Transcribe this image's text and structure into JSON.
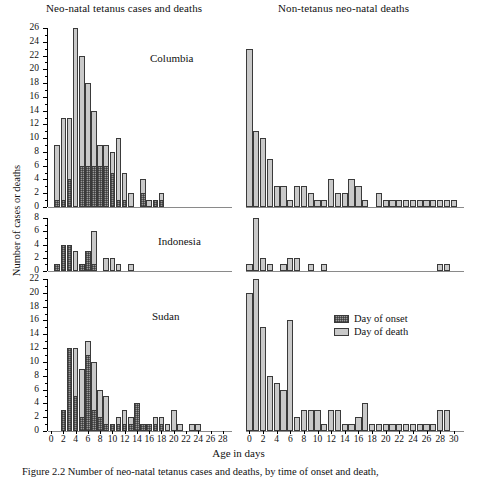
{
  "figure": {
    "column_titles": {
      "left": "Neo-natal tetanus cases and deaths",
      "right": "Non-tetanus neo-natal deaths"
    },
    "ylabel": "Number of cases or deaths",
    "xlabel": "Age in days",
    "caption": "Figure 2.2    Number of neo-natal tetanus cases and deaths, by time of onset and death,",
    "legend": {
      "position": "inside-right-middle",
      "items": [
        {
          "key": "onset",
          "label": "Day of onset"
        },
        {
          "key": "death",
          "label": "Day of death"
        }
      ]
    },
    "panel_labels": [
      "Columbia",
      "Indonesia",
      "Sudan"
    ]
  },
  "chart_data": [
    {
      "type": "bar",
      "title": "Columbia",
      "column": "Neo-natal tetanus cases and deaths",
      "xlabel": "Age in days",
      "ylabel": "Number of cases or deaths",
      "xlim": [
        0,
        29
      ],
      "ylim": [
        0,
        26
      ],
      "yticks": [
        0,
        2,
        4,
        6,
        8,
        10,
        12,
        14,
        16,
        18,
        20,
        22,
        24,
        26
      ],
      "xticks": [
        0,
        2,
        4,
        6,
        8,
        10,
        12,
        14,
        16,
        18,
        20,
        22,
        24,
        26,
        28
      ],
      "grid": false,
      "x": [
        0,
        1,
        2,
        3,
        4,
        5,
        6,
        7,
        8,
        9,
        10,
        11,
        12,
        13,
        14,
        15,
        16,
        17,
        18,
        19,
        20,
        21,
        22,
        23,
        24,
        25,
        26,
        27,
        28
      ],
      "series": [
        {
          "name": "Day of onset",
          "values": [
            0,
            1,
            1,
            4,
            0,
            6,
            6,
            6,
            6,
            6,
            5,
            1,
            1,
            0,
            0,
            2,
            0,
            1,
            1,
            0,
            0,
            0,
            0,
            0,
            0,
            0,
            0,
            0,
            0
          ]
        },
        {
          "name": "Day of death",
          "values": [
            0,
            9,
            13,
            13,
            26,
            22,
            18,
            14,
            9,
            9,
            8,
            10,
            5,
            2,
            0,
            4,
            1,
            1,
            2,
            0,
            0,
            0,
            0,
            0,
            0,
            0,
            0,
            0,
            0
          ]
        }
      ]
    },
    {
      "type": "bar",
      "title": "Indonesia",
      "column": "Neo-natal tetanus cases and deaths",
      "xlabel": "Age in days",
      "ylabel": "Number of cases or deaths",
      "xlim": [
        0,
        29
      ],
      "ylim": [
        0,
        8
      ],
      "yticks": [
        0,
        2,
        4,
        6,
        8
      ],
      "xticks": [
        0,
        2,
        4,
        6,
        8,
        10,
        12,
        14,
        16,
        18,
        20,
        22,
        24,
        26,
        28
      ],
      "grid": false,
      "x": [
        0,
        1,
        2,
        3,
        4,
        5,
        6,
        7,
        8,
        9,
        10,
        11,
        12,
        13,
        14,
        15,
        16,
        17,
        18,
        19,
        20,
        21,
        22,
        23,
        24,
        25,
        26,
        27,
        28
      ],
      "series": [
        {
          "name": "Day of onset",
          "values": [
            0,
            1,
            4,
            4,
            0,
            1,
            3,
            1,
            0,
            0,
            0,
            0,
            0,
            0,
            0,
            0,
            0,
            0,
            0,
            0,
            0,
            0,
            0,
            0,
            0,
            0,
            0,
            0,
            0
          ]
        },
        {
          "name": "Day of death",
          "values": [
            0,
            1,
            4,
            4,
            3,
            1,
            3,
            6,
            0,
            2,
            2,
            1,
            0,
            1,
            0,
            0,
            0,
            0,
            0,
            0,
            0,
            0,
            0,
            0,
            0,
            0,
            0,
            0,
            0
          ]
        }
      ]
    },
    {
      "type": "bar",
      "title": "Sudan",
      "column": "Neo-natal tetanus cases and deaths",
      "xlabel": "Age in days",
      "ylabel": "Number of cases or deaths",
      "xlim": [
        0,
        29
      ],
      "ylim": [
        0,
        22
      ],
      "yticks": [
        0,
        2,
        4,
        6,
        8,
        10,
        12,
        14,
        16,
        18,
        20,
        22
      ],
      "xticks": [
        0,
        2,
        4,
        6,
        8,
        10,
        12,
        14,
        16,
        18,
        20,
        22,
        24,
        26,
        28
      ],
      "grid": false,
      "x": [
        0,
        1,
        2,
        3,
        4,
        5,
        6,
        7,
        8,
        9,
        10,
        11,
        12,
        13,
        14,
        15,
        16,
        17,
        18,
        19,
        20,
        21,
        22,
        23,
        24,
        25,
        26,
        27,
        28
      ],
      "series": [
        {
          "name": "Day of onset",
          "values": [
            0,
            0,
            3,
            12,
            5,
            2,
            11,
            3,
            2,
            1,
            1,
            1,
            1,
            1,
            4,
            1,
            1,
            1,
            1,
            0,
            0,
            0,
            0,
            0,
            0,
            0,
            0,
            0,
            0
          ]
        },
        {
          "name": "Day of death",
          "values": [
            0,
            0,
            3,
            12,
            12,
            9,
            13,
            10,
            6,
            5,
            1,
            2,
            3,
            2,
            3,
            1,
            1,
            2,
            2,
            1,
            3,
            1,
            0,
            1,
            1,
            0,
            0,
            0,
            0
          ]
        }
      ]
    },
    {
      "type": "bar",
      "title": "Columbia",
      "column": "Non-tetanus neo-natal deaths",
      "xlabel": "Age in days",
      "ylabel": "Number of cases or deaths",
      "xlim": [
        0,
        31
      ],
      "ylim": [
        0,
        26
      ],
      "yticks": [
        0,
        2,
        4,
        6,
        8,
        10,
        12,
        14,
        16,
        18,
        20,
        22,
        24,
        26
      ],
      "xticks": [
        0,
        2,
        4,
        6,
        8,
        10,
        12,
        14,
        16,
        18,
        20,
        22,
        24,
        26,
        28,
        30
      ],
      "grid": false,
      "x": [
        0,
        1,
        2,
        3,
        4,
        5,
        6,
        7,
        8,
        9,
        10,
        11,
        12,
        13,
        14,
        15,
        16,
        17,
        18,
        19,
        20,
        21,
        22,
        23,
        24,
        25,
        26,
        27,
        28,
        29,
        30
      ],
      "series": [
        {
          "name": "Day of death",
          "values": [
            23,
            11,
            10,
            7,
            3,
            3,
            1,
            3,
            3,
            2,
            1,
            1,
            4,
            2,
            2,
            4,
            3,
            1,
            0,
            2,
            1,
            1,
            1,
            1,
            1,
            1,
            1,
            1,
            1,
            1,
            1
          ]
        }
      ]
    },
    {
      "type": "bar",
      "title": "Indonesia",
      "column": "Non-tetanus neo-natal deaths",
      "xlabel": "Age in days",
      "ylabel": "Number of cases or deaths",
      "xlim": [
        0,
        31
      ],
      "ylim": [
        0,
        8
      ],
      "yticks": [
        0,
        2,
        4,
        6,
        8
      ],
      "xticks": [
        0,
        2,
        4,
        6,
        8,
        10,
        12,
        14,
        16,
        18,
        20,
        22,
        24,
        26,
        28,
        30
      ],
      "grid": false,
      "x": [
        0,
        1,
        2,
        3,
        4,
        5,
        6,
        7,
        8,
        9,
        10,
        11,
        12,
        13,
        14,
        15,
        16,
        17,
        18,
        19,
        20,
        21,
        22,
        23,
        24,
        25,
        26,
        27,
        28,
        29,
        30
      ],
      "series": [
        {
          "name": "Day of death",
          "values": [
            1,
            8,
            2,
            1,
            0,
            1,
            2,
            2,
            0,
            1,
            0,
            1,
            0,
            0,
            0,
            0,
            0,
            0,
            0,
            0,
            0,
            0,
            0,
            0,
            0,
            0,
            0,
            0,
            1,
            1,
            0
          ]
        }
      ]
    },
    {
      "type": "bar",
      "title": "Sudan",
      "column": "Non-tetanus neo-natal deaths",
      "xlabel": "Age in days",
      "ylabel": "Number of cases or deaths",
      "xlim": [
        0,
        31
      ],
      "ylim": [
        0,
        22
      ],
      "yticks": [
        0,
        2,
        4,
        6,
        8,
        10,
        12,
        14,
        16,
        18,
        20,
        22
      ],
      "xticks": [
        0,
        2,
        4,
        6,
        8,
        10,
        12,
        14,
        16,
        18,
        20,
        22,
        24,
        26,
        28,
        30
      ],
      "grid": false,
      "x": [
        0,
        1,
        2,
        3,
        4,
        5,
        6,
        7,
        8,
        9,
        10,
        11,
        12,
        13,
        14,
        15,
        16,
        17,
        18,
        19,
        20,
        21,
        22,
        23,
        24,
        25,
        26,
        27,
        28,
        29,
        30
      ],
      "series": [
        {
          "name": "Day of death",
          "values": [
            20,
            22,
            15,
            8,
            7,
            6,
            16,
            2,
            3,
            3,
            3,
            1,
            3,
            3,
            1,
            1,
            2,
            4,
            1,
            1,
            1,
            1,
            1,
            1,
            1,
            1,
            1,
            1,
            3,
            3,
            0
          ]
        }
      ]
    }
  ]
}
